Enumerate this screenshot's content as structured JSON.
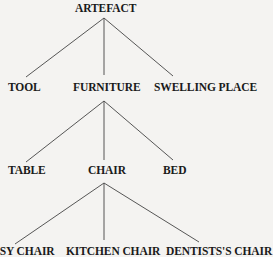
{
  "diagram": {
    "type": "tree",
    "root": {
      "label": "ARTEFACT",
      "children": [
        {
          "label": "TOOL"
        },
        {
          "label": "FURNITURE",
          "children": [
            {
              "label": "TABLE"
            },
            {
              "label": "CHAIR",
              "children": [
                {
                  "label": "EASY CHAIR"
                },
                {
                  "label": "KITCHEN CHAIR"
                },
                {
                  "label": "DENTISTS'S CHAIR"
                }
              ]
            },
            {
              "label": "BED"
            }
          ]
        },
        {
          "label": "SWELLING PLACE"
        }
      ]
    }
  },
  "nodes": {
    "artefact": "ARTEFACT",
    "tool": "TOOL",
    "furniture": "FURNITURE",
    "swelling_place": "SWELLING PLACE",
    "table": "TABLE",
    "chair": "CHAIR",
    "bed": "BED",
    "easy_chair": "EASY CHAIR",
    "kitchen_chair": "KITCHEN CHAIR",
    "dentists_chair": "DENTISTS'S CHAIR"
  }
}
